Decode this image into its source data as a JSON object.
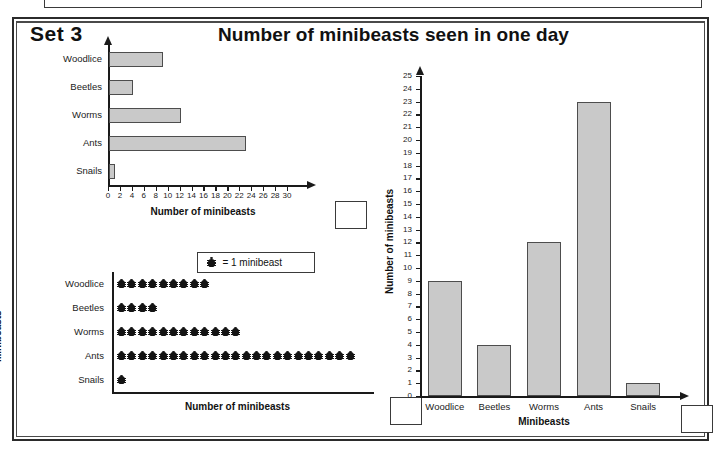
{
  "worksheet": {
    "set_label": "Set 3",
    "title": "Number of minibeasts seen in one day"
  },
  "legend": {
    "symbol_name": "beetle-symbol",
    "text": "= 1 minibeast"
  },
  "colors": {
    "bar_fill": "#c9c9c9",
    "bar_stroke": "#4d4d4d",
    "ink": "#1a1a1a",
    "page": "#ffffff"
  },
  "answer_boxes": [
    {
      "name": "answer-box-bar-chart",
      "value": ""
    },
    {
      "name": "answer-box-pictogram",
      "value": ""
    },
    {
      "name": "answer-box-column-chart",
      "value": ""
    }
  ],
  "chart_data": [
    {
      "id": "horizontal-bar-chart",
      "type": "bar",
      "orientation": "horizontal",
      "title": "",
      "categories": [
        "Woodlice",
        "Beetles",
        "Worms",
        "Ants",
        "Snails"
      ],
      "values": [
        9,
        4,
        12,
        23,
        1
      ],
      "xlabel": "Number of minibeasts",
      "ylabel": "Minibeasts",
      "xlim": [
        0,
        31
      ],
      "xticks": [
        0,
        2,
        4,
        6,
        8,
        10,
        12,
        14,
        16,
        18,
        20,
        22,
        24,
        26,
        28,
        30
      ],
      "grid": false,
      "legend": "none"
    },
    {
      "id": "pictogram",
      "type": "bar",
      "orientation": "horizontal",
      "subtype": "pictogram",
      "title": "",
      "categories": [
        "Woodlice",
        "Beetles",
        "Worms",
        "Ants",
        "Snails"
      ],
      "values": [
        9,
        4,
        12,
        23,
        1
      ],
      "symbol_value": 1,
      "symbol_label": "= 1 minibeast",
      "xlabel": "Number of minibeasts",
      "ylabel": "Minibeasts",
      "grid": false,
      "legend": "top"
    },
    {
      "id": "vertical-bar-chart",
      "type": "bar",
      "orientation": "vertical",
      "title": "",
      "categories": [
        "Woodlice",
        "Beetles",
        "Worms",
        "Ants",
        "Snails"
      ],
      "values": [
        9,
        4,
        12,
        23,
        1
      ],
      "xlabel": "Minibeasts",
      "ylabel": "Number of minibeasts",
      "ylim": [
        0,
        25
      ],
      "yticks": [
        0,
        1,
        2,
        3,
        4,
        5,
        6,
        7,
        8,
        9,
        10,
        11,
        12,
        13,
        14,
        15,
        16,
        17,
        18,
        19,
        20,
        21,
        22,
        23,
        24,
        25
      ],
      "grid": false,
      "legend": "none"
    }
  ]
}
